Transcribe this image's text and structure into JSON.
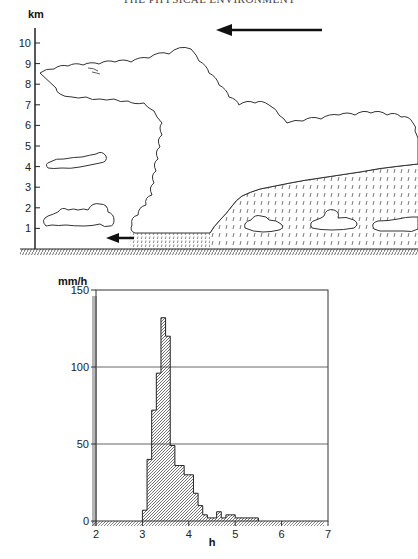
{
  "page": {
    "running_head": "THE PHYSICAL ENVIRONMENT"
  },
  "diagram": {
    "y_axis_label": "km",
    "y_ticks": [
      "1",
      "2",
      "3",
      "4",
      "5",
      "6",
      "7",
      "8",
      "9",
      "10"
    ],
    "y_range": [
      0,
      10
    ],
    "elements": [
      {
        "name": "anvil-cloud",
        "description": "Cumulonimbus anvil extending at about 9 km"
      },
      {
        "name": "stratiform-rain-region",
        "description": "Trailing stratiform cloud with rain, 1-4 km"
      },
      {
        "name": "upper-level-flow-arrow",
        "direction": "left"
      },
      {
        "name": "low-level-outflow-arrow",
        "direction": "left"
      },
      {
        "name": "isolated-cloud-4km"
      },
      {
        "name": "isolated-cloud-1-2km"
      }
    ]
  },
  "chart_data": {
    "type": "bar",
    "title": "",
    "xlabel": "h",
    "ylabel": "mm/h",
    "xlim": [
      2,
      7
    ],
    "ylim": [
      0,
      150
    ],
    "x_ticks": [
      "2",
      "3",
      "4",
      "5",
      "6",
      "7"
    ],
    "y_ticks": [
      "0",
      "50",
      "100",
      "150"
    ],
    "grid": "horizontal at 50, 100, 150",
    "bin_width": 0.1,
    "bins": [
      {
        "x": 3.0,
        "value": 7
      },
      {
        "x": 3.1,
        "value": 40
      },
      {
        "x": 3.2,
        "value": 72
      },
      {
        "x": 3.3,
        "value": 96
      },
      {
        "x": 3.4,
        "value": 132
      },
      {
        "x": 3.5,
        "value": 120
      },
      {
        "x": 3.6,
        "value": 49
      },
      {
        "x": 3.7,
        "value": 36
      },
      {
        "x": 3.8,
        "value": 36
      },
      {
        "x": 3.9,
        "value": 30
      },
      {
        "x": 4.0,
        "value": 30
      },
      {
        "x": 4.1,
        "value": 18
      },
      {
        "x": 4.2,
        "value": 10
      },
      {
        "x": 4.3,
        "value": 4
      },
      {
        "x": 4.4,
        "value": 2
      },
      {
        "x": 4.5,
        "value": 2
      },
      {
        "x": 4.6,
        "value": 6
      },
      {
        "x": 4.7,
        "value": 2
      },
      {
        "x": 4.8,
        "value": 4
      },
      {
        "x": 4.9,
        "value": 4
      },
      {
        "x": 5.0,
        "value": 2
      },
      {
        "x": 5.1,
        "value": 2
      },
      {
        "x": 5.2,
        "value": 2
      },
      {
        "x": 5.3,
        "value": 2
      },
      {
        "x": 5.4,
        "value": 2
      }
    ]
  }
}
